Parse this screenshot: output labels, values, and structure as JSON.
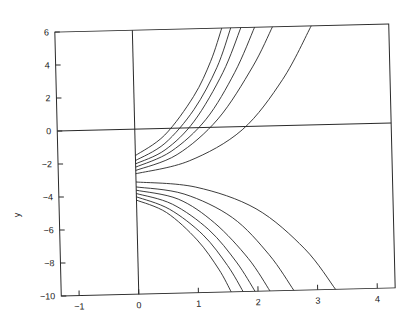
{
  "chart_data": {
    "type": "line",
    "title": "",
    "xlabel": "",
    "ylabel": "y",
    "xlim": [
      -1.3,
      4.3
    ],
    "ylim": [
      -10,
      6
    ],
    "xticks": [
      -1,
      0,
      1,
      2,
      3,
      4
    ],
    "yticks": [
      6,
      4,
      2,
      0,
      -2,
      -4,
      -6,
      -8,
      -10
    ],
    "xtick_labels": [
      "-1",
      "0",
      "1",
      "2",
      "3",
      "4"
    ],
    "ytick_labels": [
      "6",
      "4",
      "2",
      "0",
      "-2",
      "-4",
      "-6",
      "-8",
      "-10"
    ],
    "grid": false,
    "legend": null,
    "reference_lines": [
      {
        "orientation": "horizontal",
        "value": 0
      },
      {
        "orientation": "vertical",
        "value": 0
      }
    ],
    "series": [
      {
        "name": "upper-1",
        "x": [
          0,
          0.5,
          1.0,
          1.3,
          1.5
        ],
        "y": [
          -1.6,
          -0.4,
          1.9,
          4.0,
          6.0
        ]
      },
      {
        "name": "upper-2",
        "x": [
          0,
          0.5,
          1.0,
          1.4,
          1.65
        ],
        "y": [
          -1.9,
          -0.9,
          1.1,
          3.6,
          6.0
        ]
      },
      {
        "name": "upper-3",
        "x": [
          0,
          0.5,
          1.0,
          1.5,
          1.82
        ],
        "y": [
          -2.1,
          -1.3,
          0.4,
          3.3,
          6.0
        ]
      },
      {
        "name": "upper-4",
        "x": [
          0,
          0.6,
          1.2,
          1.7,
          2.05
        ],
        "y": [
          -2.3,
          -1.4,
          0.5,
          3.3,
          6.0
        ]
      },
      {
        "name": "upper-5",
        "x": [
          0,
          0.7,
          1.4,
          2.0,
          2.35
        ],
        "y": [
          -2.5,
          -1.6,
          0.5,
          3.6,
          6.0
        ]
      },
      {
        "name": "upper-6",
        "x": [
          0,
          0.9,
          1.8,
          2.5,
          3.0
        ],
        "y": [
          -2.7,
          -2.0,
          -0.2,
          2.8,
          6.0
        ]
      },
      {
        "name": "lower-1",
        "x": [
          0,
          1.0,
          2.0,
          2.8,
          3.3
        ],
        "y": [
          -3.2,
          -3.6,
          -5.0,
          -7.5,
          -10.0
        ]
      },
      {
        "name": "lower-2",
        "x": [
          0,
          0.8,
          1.6,
          2.2,
          2.6
        ],
        "y": [
          -3.5,
          -4.0,
          -5.5,
          -7.8,
          -10.0
        ]
      },
      {
        "name": "lower-3",
        "x": [
          0,
          0.7,
          1.3,
          1.85,
          2.2
        ],
        "y": [
          -3.7,
          -4.3,
          -5.8,
          -8.0,
          -10.0
        ]
      },
      {
        "name": "lower-4",
        "x": [
          0,
          0.6,
          1.2,
          1.65,
          1.95
        ],
        "y": [
          -3.9,
          -4.6,
          -6.2,
          -8.2,
          -10.0
        ]
      },
      {
        "name": "lower-5",
        "x": [
          0,
          0.55,
          1.1,
          1.5,
          1.75
        ],
        "y": [
          -4.1,
          -4.9,
          -6.5,
          -8.4,
          -10.0
        ]
      },
      {
        "name": "lower-6",
        "x": [
          0,
          0.5,
          1.0,
          1.35,
          1.55
        ],
        "y": [
          -4.3,
          -5.1,
          -6.8,
          -8.6,
          -10.0
        ]
      }
    ]
  },
  "style": {
    "line_color": "#2a2a2a",
    "frame_color": "#2a2a2a",
    "background": "#ffffff"
  }
}
